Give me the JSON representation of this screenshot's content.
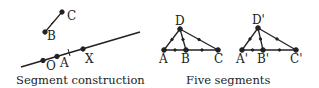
{
  "figures": [
    {
      "caption": "Segment construction",
      "labels": {
        "C": "C",
        "B": "B",
        "O": "O",
        "A": "A",
        "X": "X"
      }
    },
    {
      "caption": "Five segments",
      "labels": {
        "D": "D",
        "A": "A",
        "B": "B",
        "C": "C"
      },
      "labels_prime": {
        "D": "D'",
        "A": "A'",
        "B": "B'",
        "C": "C'"
      }
    }
  ],
  "colors": {
    "ink": "#222222",
    "background": "#ffffff"
  }
}
